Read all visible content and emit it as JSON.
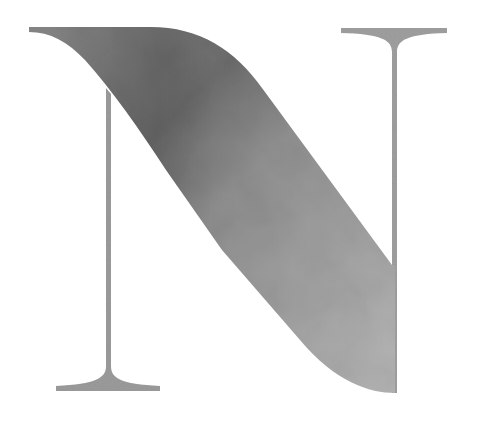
{
  "artwork": {
    "letter": "N",
    "style": "textured gray serif monogram letter",
    "colors": {
      "background": "#ffffff",
      "diagonal_dark": "#727272",
      "diagonal_mid": "#8f8f8f",
      "diagonal_light": "#b3b3b3",
      "stem": "#9a9a9a",
      "serif": "#a8a8a8"
    }
  }
}
